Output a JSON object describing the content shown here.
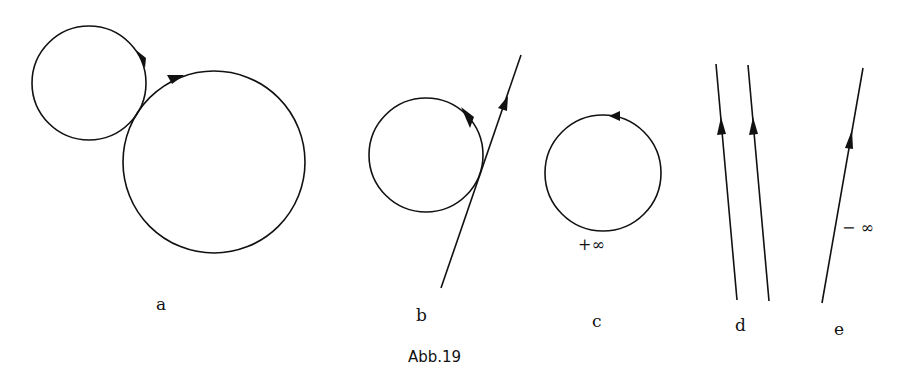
{
  "figure": {
    "caption": "Abb.19",
    "panels": [
      {
        "id": "a",
        "label": "a",
        "annotation": ""
      },
      {
        "id": "b",
        "label": "b",
        "annotation": ""
      },
      {
        "id": "c",
        "label": "c",
        "annotation": "+∞"
      },
      {
        "id": "d",
        "label": "d",
        "annotation": ""
      },
      {
        "id": "e",
        "label": "e",
        "annotation": "− ∞"
      }
    ]
  },
  "colors": {
    "ink": "#111111",
    "paper": "#ffffff"
  }
}
